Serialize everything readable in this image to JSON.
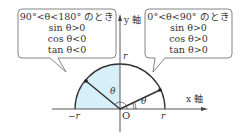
{
  "diagram": {
    "axes": {
      "x_label": "x 軸",
      "y_label": "y 軸",
      "origin_label": "O",
      "neg_r_label": "−r",
      "pos_r_label": "r",
      "top_r_label": "r"
    },
    "angle_labels": {
      "theta_obtuse": "θ",
      "theta_acute": "θ"
    },
    "fill_color": "#d8f0f8",
    "bubble_left": {
      "condition": "90°<θ<180° のとき",
      "sin": "sin θ>0",
      "cos": "cos θ<0",
      "tan": "tan θ<0"
    },
    "bubble_right": {
      "condition": "0°<θ<90° のとき",
      "sin": "sin θ>0",
      "cos": "cos θ>0",
      "tan": "tan θ>0"
    }
  }
}
